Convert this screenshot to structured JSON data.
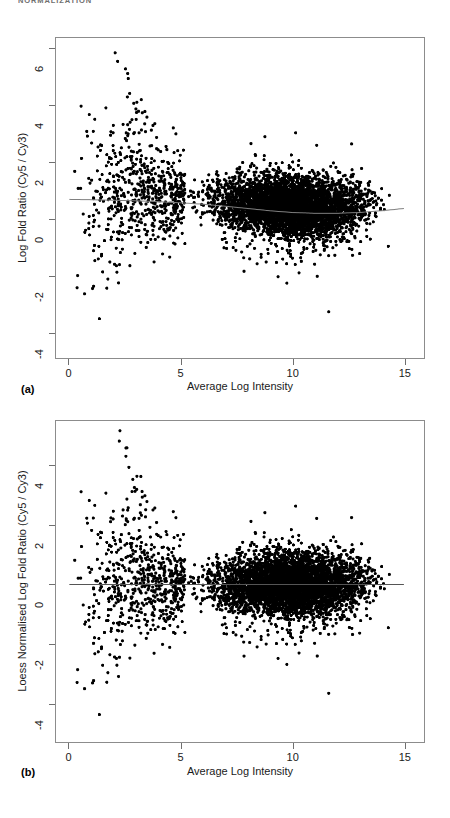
{
  "document": {
    "running_header": "NORMALIZATION"
  },
  "figure": {
    "panels": [
      {
        "id": "panel-a",
        "label": "(a)",
        "xlabel": "Average Log Intensity",
        "ylabel": "Log Fold Ratio (Cy5 / Cy3)"
      },
      {
        "id": "panel-b",
        "label": "(b)",
        "xlabel": "Average Log Intensity",
        "ylabel": "Loess Normalised Log Fold Ratio (Cy5 / Cy3)"
      }
    ]
  },
  "chart_data": [
    {
      "type": "scatter",
      "panel": "a",
      "title": "",
      "xlabel": "Average Log Intensity",
      "ylabel": "Log Fold Ratio (Cy5 / Cy3)",
      "xlim": [
        -0.6,
        15.9
      ],
      "ylim": [
        -4.9,
        6.4
      ],
      "xticks": [
        0,
        5,
        10,
        15
      ],
      "yticks": [
        -4,
        -2,
        0,
        2,
        4,
        6
      ],
      "xtick_labels": [
        "0",
        "5",
        "10",
        "15"
      ],
      "ytick_labels": [
        "-4",
        "-2",
        "0",
        "2",
        "4",
        "6"
      ],
      "grid": false,
      "legend": "none",
      "n_points": 5200,
      "marker": {
        "shape": "circle",
        "size_px": 3.1,
        "color": "#000000"
      },
      "description": "MA plot before normalisation: log fold ratio vs average log intensity. Dense lobe spans A from about 5 to 14.5 centred on M slightly above 0; a sparse fan of outliers spreads from A 0 to 5 with M from -4.3 up to 5.8, including a diagonal streak of high points near A 2.5-3.5.",
      "loess_curve": {
        "name": "loess fit",
        "color": "#808080",
        "width_px": 1.0,
        "x": [
          0.0,
          1.0,
          2.0,
          3.0,
          4.0,
          5.0,
          6.0,
          7.0,
          8.0,
          9.0,
          10.0,
          11.0,
          12.0,
          13.0,
          14.0,
          15.0
        ],
        "y": [
          0.7,
          0.69,
          0.67,
          0.65,
          0.62,
          0.58,
          0.53,
          0.46,
          0.38,
          0.3,
          0.24,
          0.21,
          0.21,
          0.24,
          0.3,
          0.38
        ]
      },
      "cluster_dense": {
        "x_range": [
          4.8,
          14.6
        ],
        "x_peak": 10.4,
        "m_center_offset_from_loess": 0.18,
        "m_spread": 0.42
      },
      "cluster_sparse": {
        "x_range": [
          0.2,
          5.2
        ],
        "m_range": [
          -4.3,
          5.9
        ]
      },
      "streak_high": {
        "x_range": [
          2.2,
          3.6
        ],
        "m_range": [
          2.4,
          5.9
        ],
        "n": 14
      }
    },
    {
      "type": "scatter",
      "panel": "b",
      "title": "",
      "xlabel": "Average Log Intensity",
      "ylabel": "Loess Normalised Log Fold Ratio (Cy5 / Cy3)",
      "xlim": [
        -0.6,
        15.9
      ],
      "ylim": [
        -5.3,
        5.5
      ],
      "xticks": [
        0,
        5,
        10,
        15
      ],
      "yticks": [
        -4,
        -2,
        0,
        2,
        4
      ],
      "xtick_labels": [
        "0",
        "5",
        "10",
        "15"
      ],
      "ytick_labels": [
        "-4",
        "-2",
        "0",
        "2",
        "4"
      ],
      "grid": false,
      "legend": "none",
      "n_points": 5200,
      "marker": {
        "shape": "circle",
        "size_px": 3.1,
        "color": "#000000"
      },
      "description": "MA plot after loess normalisation: the same data with the loess trend subtracted, so the dense lobe is centred on M = 0 across the full intensity range; the reference line is flat at 0.",
      "loess_curve": {
        "name": "normalised reference (y = 0)",
        "color": "#555555",
        "width_px": 1.0,
        "x": [
          0.0,
          15.0
        ],
        "y": [
          0.0,
          0.0
        ]
      },
      "cluster_dense": {
        "x_range": [
          4.8,
          14.6
        ],
        "x_peak": 10.4,
        "m_center_offset_from_loess": 0.0,
        "m_spread": 0.42
      },
      "cluster_sparse": {
        "x_range": [
          0.2,
          5.2
        ],
        "m_range": [
          -4.9,
          5.2
        ]
      },
      "streak_high": {
        "x_range": [
          2.2,
          3.6
        ],
        "m_range": [
          1.8,
          5.2
        ],
        "n": 14
      }
    }
  ]
}
